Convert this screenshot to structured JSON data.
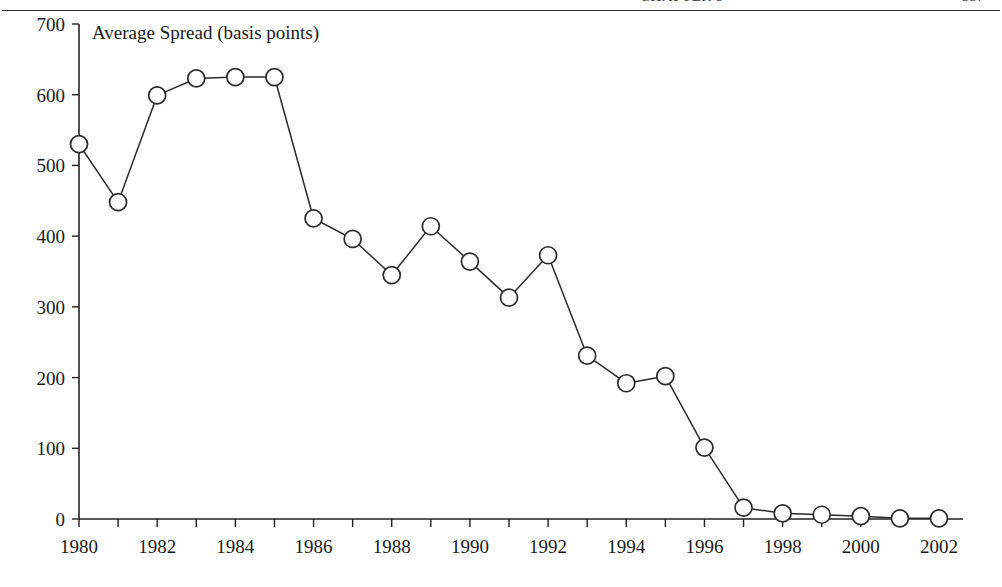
{
  "page": {
    "header_running_text": "CHAPTER 9",
    "header_folio": "337",
    "header_rule": "horizontal-rule"
  },
  "chart_data": {
    "type": "line",
    "title": "Average Spread (basis points)",
    "xlabel": "",
    "ylabel": "",
    "ylim": [
      0,
      700
    ],
    "xlim": [
      1980,
      2002
    ],
    "ytick_step": 100,
    "xtick_step": 1,
    "xtick_label_step": 2,
    "grid": false,
    "legend": "none",
    "marker": "open-circle",
    "yticks": [
      0,
      100,
      200,
      300,
      400,
      500,
      600,
      700
    ],
    "ytick_labels": [
      "0",
      "100",
      "200",
      "300",
      "400",
      "500",
      "600",
      "700"
    ],
    "xticks": [
      1980,
      1981,
      1982,
      1983,
      1984,
      1985,
      1986,
      1987,
      1988,
      1989,
      1990,
      1991,
      1992,
      1993,
      1994,
      1995,
      1996,
      1997,
      1998,
      1999,
      2000,
      2001,
      2002
    ],
    "xtick_labels": [
      "1980",
      "",
      "1982",
      "",
      "1984",
      "",
      "1986",
      "",
      "1988",
      "",
      "1990",
      "",
      "1992",
      "",
      "1994",
      "",
      "1996",
      "",
      "1998",
      "",
      "2000",
      "",
      "2002"
    ],
    "x": [
      1980,
      1981,
      1982,
      1983,
      1984,
      1985,
      1986,
      1987,
      1988,
      1989,
      1990,
      1991,
      1992,
      1993,
      1994,
      1995,
      1996,
      1997,
      1998,
      1999,
      2000,
      2001,
      2002
    ],
    "values": [
      530,
      448,
      599,
      623,
      625,
      625,
      425,
      396,
      345,
      414,
      364,
      313,
      373,
      231,
      192,
      202,
      101,
      16,
      8,
      6,
      4,
      1,
      1
    ],
    "series": [
      {
        "name": "Average Spread (basis points)",
        "values": [
          530,
          448,
          599,
          623,
          625,
          625,
          425,
          396,
          345,
          414,
          364,
          313,
          373,
          231,
          192,
          202,
          101,
          16,
          8,
          6,
          4,
          1,
          1
        ]
      }
    ],
    "colors": {
      "line": "#2b2b2b",
      "marker_fill": "#ffffff",
      "marker_stroke": "#2b2b2b",
      "axis": "#222222",
      "text": "#1a1a1a"
    }
  }
}
